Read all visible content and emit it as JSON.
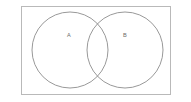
{
  "figure": {
    "name": "venn-diagram-two-sets",
    "background_color": "#ffffff",
    "canvas": {
      "width": 191,
      "height": 102
    }
  },
  "universal_set": {
    "shape": "rectangle",
    "label": "",
    "x": 21,
    "y": 6,
    "width": 150,
    "height": 89,
    "stroke_color": "#b9b9b9",
    "stroke_width": 1,
    "fill": "none"
  },
  "sets": [
    {
      "label": "A",
      "shape": "circle",
      "cx": 70,
      "cy": 50,
      "r": 38,
      "stroke_color": "#8d8d8d",
      "stroke_width": 0.9,
      "fill": "none",
      "label_x": 69,
      "label_y": 36,
      "label_color": "#6b6b6b"
    },
    {
      "label": "B",
      "shape": "circle",
      "cx": 125,
      "cy": 50,
      "r": 38,
      "stroke_color": "#8d8d8d",
      "stroke_width": 0.9,
      "fill": "none",
      "label_x": 125,
      "label_y": 36,
      "label_color": "#6b6b6b"
    }
  ],
  "intersection": {
    "present": true,
    "left_x": 93,
    "right_x": 108,
    "top_y": 22,
    "bottom_y": 78,
    "label": ""
  }
}
